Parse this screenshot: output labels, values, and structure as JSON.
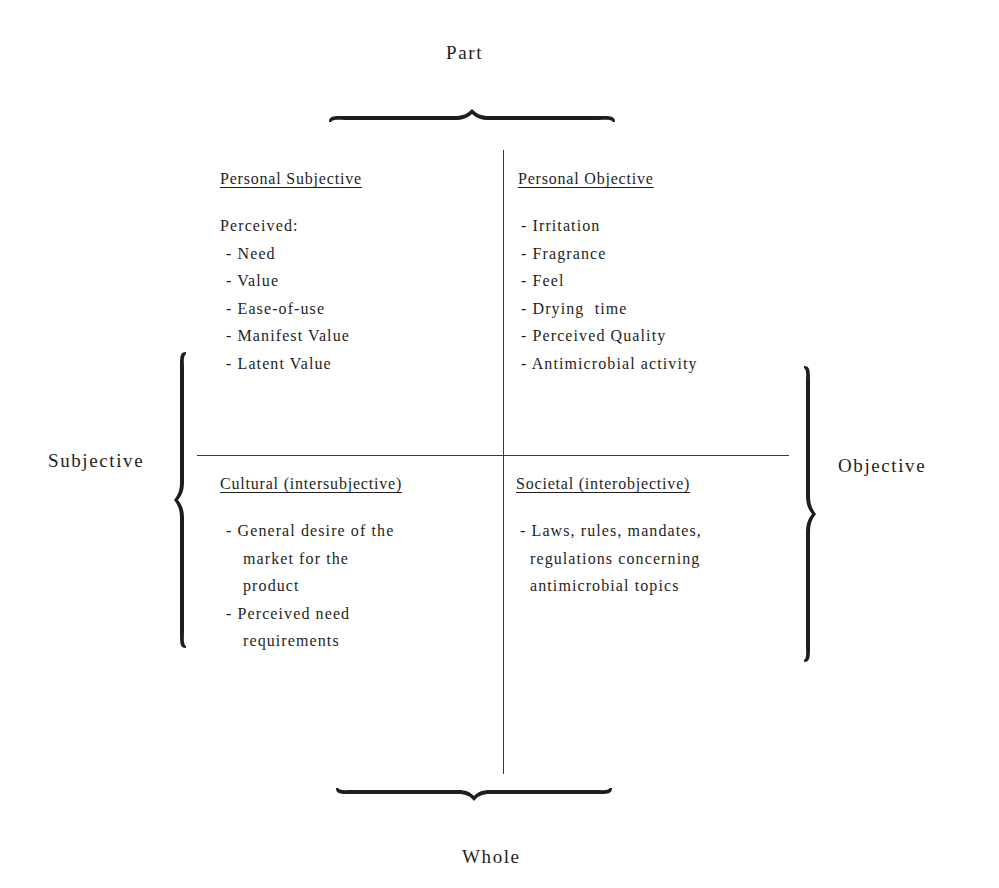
{
  "axes": {
    "top": "Part",
    "bottom": "Whole",
    "left": "Subjective",
    "right": "Objective"
  },
  "quadrants": {
    "top_left": {
      "title": "Personal Subjective",
      "intro": "Perceived:",
      "items": [
        "- Need",
        "- Value",
        "- Ease-of-use",
        "- Manifest Value",
        "- Latent Value"
      ]
    },
    "top_right": {
      "title": "Personal Objective",
      "items": [
        "- Irritation",
        "- Fragrance",
        "- Feel",
        "- Drying  time",
        "- Perceived Quality",
        "- Antimicrobial activity"
      ]
    },
    "bottom_left": {
      "title": "Cultural (intersubjective)",
      "items": [
        {
          "first": "- General desire of the",
          "continuation": [
            "market for the",
            "product"
          ]
        },
        {
          "first": "- Perceived need",
          "continuation": [
            "requirements"
          ]
        }
      ]
    },
    "bottom_right": {
      "title": "Societal (interobjective)",
      "items": [
        {
          "first": "- Laws, rules, mandates,",
          "continuation": [
            "regulations concerning",
            "antimicrobial topics"
          ]
        }
      ]
    }
  },
  "colors": {
    "ink": "#1e1e1e",
    "line": "#3a3a3a",
    "background": "#ffffff"
  }
}
